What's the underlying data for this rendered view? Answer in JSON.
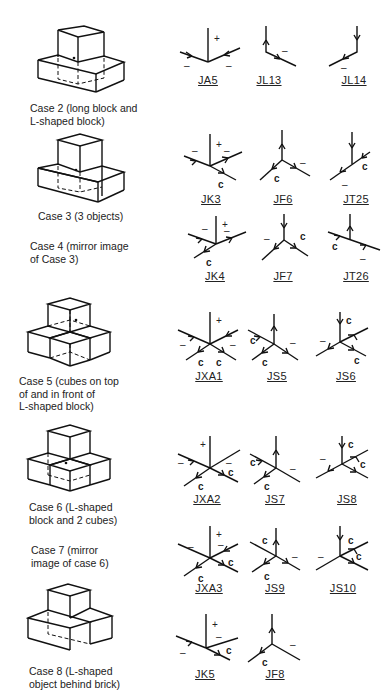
{
  "cases": [
    {
      "id": "case2",
      "caption": "Case 2 (long block and\nL-shaped block)",
      "junctions": [
        "JA5",
        "JL13",
        "JL14"
      ]
    },
    {
      "id": "case3",
      "caption": "Case 3 (3 objects)",
      "junctions": [
        "JK3",
        "JF6",
        "JT25"
      ]
    },
    {
      "id": "case4",
      "caption": "Case 4 (mirror image\nof Case 3)",
      "junctions": [
        "JK4",
        "JF7",
        "JT26"
      ]
    },
    {
      "id": "case5",
      "caption": "Case 5 (cubes on top\nof and in front of\nL-shaped block)",
      "junctions": [
        "JXA1",
        "JS5",
        "JS6"
      ]
    },
    {
      "id": "case6",
      "caption": "Case 6 (L-shaped\nblock and 2 cubes)",
      "junctions": [
        "JXA2",
        "JS7",
        "JS8"
      ]
    },
    {
      "id": "case7",
      "caption": "Case 7 (mirror\nimage of case 6)",
      "junctions": [
        "JXA3",
        "JS9",
        "JS10"
      ]
    },
    {
      "id": "case8",
      "caption": "Case 8 (L-shaped\nobject behind brick)",
      "junctions": [
        "JK5",
        "JF8"
      ]
    }
  ],
  "legend": {
    "plus": "+",
    "minus": "–",
    "concave": "c"
  }
}
